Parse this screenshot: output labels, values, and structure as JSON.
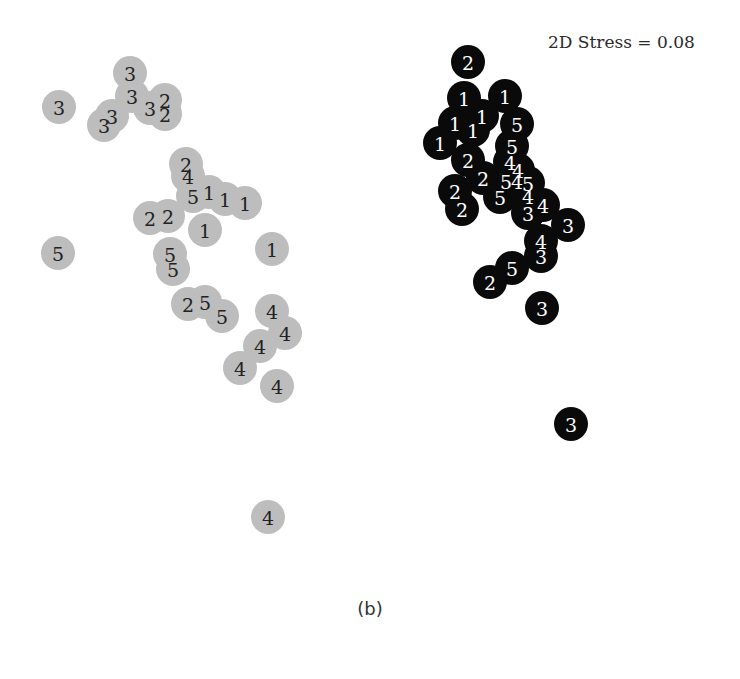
{
  "chart_data": {
    "type": "scatter",
    "title": "",
    "subtitle": "",
    "xlabel": "",
    "ylabel": "",
    "grid": false,
    "axes_visible": false,
    "legend": null,
    "annotation": "2D Stress = 0.08",
    "caption": "(b)",
    "marker": {
      "shape": "circle",
      "radius_px": 17,
      "label_inside": true
    },
    "coordinate_system": "pixel (x right, y down) within 740x679 figure",
    "series": [
      {
        "name": "group-grey",
        "fill": "#bdbdbd",
        "text_color": "#222222",
        "points": [
          {
            "x": 130,
            "y": 73,
            "label": "3"
          },
          {
            "x": 59,
            "y": 107,
            "label": "3"
          },
          {
            "x": 132,
            "y": 96,
            "label": "3"
          },
          {
            "x": 150,
            "y": 108,
            "label": "3"
          },
          {
            "x": 165,
            "y": 100,
            "label": "2"
          },
          {
            "x": 165,
            "y": 114,
            "label": "2"
          },
          {
            "x": 112,
            "y": 116,
            "label": "3"
          },
          {
            "x": 104,
            "y": 125,
            "label": "3"
          },
          {
            "x": 186,
            "y": 164,
            "label": "2"
          },
          {
            "x": 188,
            "y": 176,
            "label": "4"
          },
          {
            "x": 193,
            "y": 196,
            "label": "5"
          },
          {
            "x": 209,
            "y": 192,
            "label": "1"
          },
          {
            "x": 225,
            "y": 199,
            "label": "1"
          },
          {
            "x": 245,
            "y": 203,
            "label": "1"
          },
          {
            "x": 150,
            "y": 218,
            "label": "2"
          },
          {
            "x": 168,
            "y": 216,
            "label": "2"
          },
          {
            "x": 205,
            "y": 230,
            "label": "1"
          },
          {
            "x": 272,
            "y": 249,
            "label": "1"
          },
          {
            "x": 58,
            "y": 253,
            "label": "5"
          },
          {
            "x": 170,
            "y": 254,
            "label": "5"
          },
          {
            "x": 173,
            "y": 269,
            "label": "5"
          },
          {
            "x": 188,
            "y": 304,
            "label": "2"
          },
          {
            "x": 205,
            "y": 302,
            "label": "5"
          },
          {
            "x": 222,
            "y": 316,
            "label": "5"
          },
          {
            "x": 272,
            "y": 311,
            "label": "4"
          },
          {
            "x": 285,
            "y": 333,
            "label": "4"
          },
          {
            "x": 260,
            "y": 346,
            "label": "4"
          },
          {
            "x": 240,
            "y": 368,
            "label": "4"
          },
          {
            "x": 277,
            "y": 386,
            "label": "4"
          },
          {
            "x": 268,
            "y": 517,
            "label": "4"
          }
        ]
      },
      {
        "name": "group-black",
        "fill": "#0a0a0a",
        "text_color": "#ffffff",
        "points": [
          {
            "x": 468,
            "y": 62,
            "label": "2"
          },
          {
            "x": 464,
            "y": 98,
            "label": "1"
          },
          {
            "x": 505,
            "y": 96,
            "label": "1"
          },
          {
            "x": 482,
            "y": 116,
            "label": "1"
          },
          {
            "x": 455,
            "y": 123,
            "label": "1"
          },
          {
            "x": 473,
            "y": 130,
            "label": "1"
          },
          {
            "x": 440,
            "y": 143,
            "label": "1"
          },
          {
            "x": 517,
            "y": 124,
            "label": "5"
          },
          {
            "x": 512,
            "y": 146,
            "label": "5"
          },
          {
            "x": 468,
            "y": 160,
            "label": "2"
          },
          {
            "x": 510,
            "y": 162,
            "label": "4"
          },
          {
            "x": 518,
            "y": 170,
            "label": "4"
          },
          {
            "x": 483,
            "y": 178,
            "label": "2"
          },
          {
            "x": 506,
            "y": 181,
            "label": "5"
          },
          {
            "x": 517,
            "y": 181,
            "label": "4"
          },
          {
            "x": 528,
            "y": 183,
            "label": "5"
          },
          {
            "x": 455,
            "y": 191,
            "label": "2"
          },
          {
            "x": 500,
            "y": 197,
            "label": "5"
          },
          {
            "x": 528,
            "y": 196,
            "label": "4"
          },
          {
            "x": 462,
            "y": 209,
            "label": "2"
          },
          {
            "x": 543,
            "y": 205,
            "label": "4"
          },
          {
            "x": 528,
            "y": 213,
            "label": "3"
          },
          {
            "x": 568,
            "y": 225,
            "label": "3"
          },
          {
            "x": 541,
            "y": 241,
            "label": "4"
          },
          {
            "x": 541,
            "y": 256,
            "label": "3"
          },
          {
            "x": 512,
            "y": 268,
            "label": "5"
          },
          {
            "x": 490,
            "y": 282,
            "label": "2"
          },
          {
            "x": 542,
            "y": 308,
            "label": "3"
          },
          {
            "x": 571,
            "y": 424,
            "label": "3"
          }
        ]
      }
    ]
  },
  "figure": {
    "stress_label": "2D Stress = 0.08",
    "caption": "(b)"
  }
}
